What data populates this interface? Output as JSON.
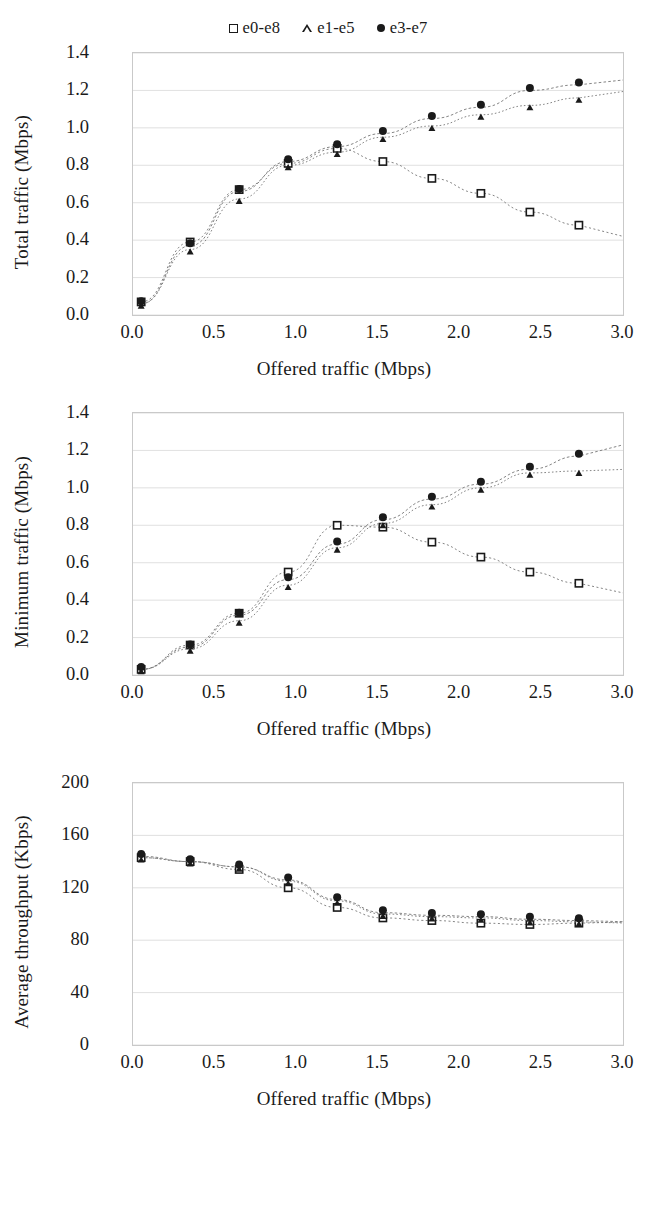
{
  "legend": {
    "items": [
      {
        "marker": "square-marker",
        "label": "e0-e8"
      },
      {
        "marker": "triangle-marker",
        "label": "e1-e5"
      },
      {
        "marker": "circle-marker",
        "label": "e3-e7"
      }
    ]
  },
  "axis": {
    "x_label": "Offered traffic (Mbps)",
    "x_ticks": [
      "0.0",
      "0.5",
      "1.0",
      "1.5",
      "2.0",
      "2.5",
      "3.0"
    ],
    "y_ticks_mbps": [
      "0.0",
      "0.2",
      "0.4",
      "0.6",
      "0.8",
      "1.0",
      "1.2",
      "1.4"
    ],
    "y_ticks_kbps": [
      "0",
      "40",
      "80",
      "120",
      "160",
      "200"
    ]
  },
  "colors": {
    "ink": "#1a1a1a",
    "frame": "#c9c9c9",
    "gridline": "#d8d8d8"
  },
  "chart_data": [
    {
      "type": "scatter",
      "title": "",
      "xlabel": "Offered traffic (Mbps)",
      "ylabel": "Total traffic (Mbps)",
      "xlim": [
        0.0,
        3.0
      ],
      "ylim": [
        0.0,
        1.4
      ],
      "grid": true,
      "legend_position": "top-center",
      "x": [
        0.05,
        0.35,
        0.65,
        0.95,
        1.25,
        1.53,
        1.83,
        2.13,
        2.43,
        2.73
      ],
      "series": [
        {
          "name": "e0-e8",
          "marker": "square",
          "values": [
            0.07,
            0.39,
            0.67,
            0.81,
            0.89,
            0.82,
            0.73,
            0.65,
            0.55,
            0.48
          ]
        },
        {
          "name": "e1-e5",
          "marker": "triangle",
          "values": [
            0.06,
            0.35,
            0.62,
            0.8,
            0.87,
            0.95,
            1.01,
            1.07,
            1.12,
            1.16
          ]
        },
        {
          "name": "e3-e7",
          "marker": "circle",
          "values": [
            0.06,
            0.37,
            0.66,
            0.82,
            0.9,
            0.97,
            1.05,
            1.11,
            1.2,
            1.23
          ]
        }
      ]
    },
    {
      "type": "scatter",
      "title": "",
      "xlabel": "Offered traffic (Mbps)",
      "ylabel": "Minimum traffic (Mbps)",
      "xlim": [
        0.0,
        3.0
      ],
      "ylim": [
        0.0,
        1.4
      ],
      "grid": true,
      "legend_position": "top-center",
      "x": [
        0.05,
        0.35,
        0.65,
        0.95,
        1.25,
        1.53,
        1.83,
        2.13,
        2.43,
        2.73
      ],
      "series": [
        {
          "name": "e0-e8",
          "marker": "square",
          "values": [
            0.03,
            0.16,
            0.33,
            0.55,
            0.8,
            0.79,
            0.71,
            0.63,
            0.55,
            0.49
          ]
        },
        {
          "name": "e1-e5",
          "marker": "triangle",
          "values": [
            0.03,
            0.14,
            0.29,
            0.48,
            0.68,
            0.81,
            0.91,
            1.0,
            1.08,
            1.09
          ]
        },
        {
          "name": "e3-e7",
          "marker": "circle",
          "values": [
            0.03,
            0.15,
            0.32,
            0.51,
            0.7,
            0.83,
            0.94,
            1.02,
            1.1,
            1.17
          ]
        }
      ]
    },
    {
      "type": "scatter",
      "title": "",
      "xlabel": "Offered traffic (Mbps)",
      "ylabel": "Average throughput (Kbps)",
      "xlim": [
        0.0,
        3.0
      ],
      "ylim": [
        0,
        200
      ],
      "grid": true,
      "legend_position": "top-center",
      "x": [
        0.05,
        0.35,
        0.65,
        0.95,
        1.25,
        1.53,
        1.83,
        2.13,
        2.43,
        2.73
      ],
      "series": [
        {
          "name": "e0-e8",
          "marker": "square",
          "values": [
            143,
            140,
            134,
            120,
            105,
            97,
            95,
            93,
            92,
            93
          ]
        },
        {
          "name": "e1-e5",
          "marker": "triangle",
          "values": [
            143,
            140,
            136,
            125,
            110,
            100,
            98,
            97,
            95,
            94
          ]
        },
        {
          "name": "e3-e7",
          "marker": "circle",
          "values": [
            144,
            140,
            136,
            126,
            111,
            101,
            99,
            98,
            96,
            95
          ]
        }
      ]
    }
  ]
}
